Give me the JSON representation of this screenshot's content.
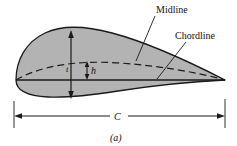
{
  "figure": {
    "caption": "(a)",
    "fill_color": "#b3b3b3",
    "outline_color": "#1a1a1a",
    "background_color": "#ffffff",
    "labels": {
      "midline": "Midline",
      "chordline": "Chordline",
      "camber_height": "h",
      "thickness": "t",
      "chord": "C"
    },
    "annotations": [
      {
        "name": "midline-label",
        "text": "Midline",
        "leader_from": [
          155,
          16
        ],
        "leader_to": [
          136,
          61
        ]
      },
      {
        "name": "chordline-label",
        "text": "Chordline",
        "leader_from": [
          186,
          42
        ],
        "leader_to": [
          157,
          79
        ]
      },
      {
        "name": "camber-height-dimension",
        "text": "h",
        "arrow_top": [
          87,
          62
        ],
        "arrow_bottom": [
          87,
          78
        ]
      },
      {
        "name": "thickness-dimension",
        "text": "t",
        "arrow_top": [
          71,
          32
        ],
        "arrow_bottom": [
          71,
          97
        ]
      },
      {
        "name": "chord-dimension",
        "text": "C",
        "arrow_left": [
          14,
          116
        ],
        "arrow_right": [
          225,
          116
        ]
      }
    ]
  }
}
